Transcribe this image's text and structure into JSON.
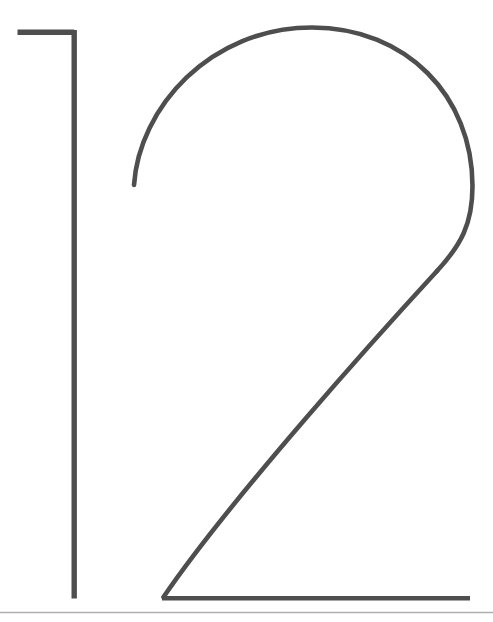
{
  "document": {
    "title": "12",
    "page_number": "12",
    "description": "Large outline-drawn display numerals '12' above a thin horizontal rule"
  },
  "canvas": {
    "width": 493,
    "height": 622,
    "background_color": "#ffffff"
  },
  "colors": {
    "stroke": "#4e4e4e",
    "rule": "#b0b0b0",
    "background": "#ffffff"
  },
  "numerals": [
    {
      "character": "1",
      "name": "digit-one",
      "stroke_color": "#4e4e4e",
      "stroke_width": 5.4,
      "strokes": [
        {
          "name": "one-top-flag",
          "type": "line",
          "path": "M 17.5 32.2 L 74.2 32.2"
        },
        {
          "name": "one-vertical-stem",
          "type": "line",
          "path": "M 74.2 30.0 L 74.2 598.5"
        }
      ]
    },
    {
      "character": "2",
      "name": "digit-two",
      "stroke_color": "#4e4e4e",
      "stroke_width": 4.6,
      "strokes": [
        {
          "name": "two-arch-and-bowl",
          "type": "curve",
          "path": "M 134.0 185.0 C 139.0 108.0 210.0 27.5 312.0 27.5 C 406.0 27.5 472.5 96.0 472.5 186.0 C 472.5 224.0 461.0 245.0 437.0 271.0"
        },
        {
          "name": "two-diagonal",
          "type": "curve",
          "path": "M 437.0 271.0 C 380.0 333.0 232.0 497.0 163.5 597.0"
        },
        {
          "name": "two-baseline",
          "type": "line",
          "path": "M 162.0 598.2 L 470.0 598.2"
        }
      ]
    }
  ],
  "rule": {
    "name": "bottom-divider-rule",
    "color": "#b0b0b0",
    "thickness": 1.4,
    "y": 612.5,
    "x_start": 0,
    "x_end": 493
  }
}
